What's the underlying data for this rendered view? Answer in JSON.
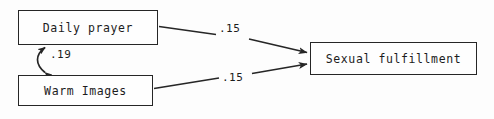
{
  "diagram": {
    "type": "path-diagram",
    "nodes": [
      {
        "id": "daily-prayer",
        "label": "Daily prayer"
      },
      {
        "id": "warm-images",
        "label": "Warm Images"
      },
      {
        "id": "sexual-fulfillment",
        "label": "Sexual fulfillment"
      }
    ],
    "edges": [
      {
        "id": "prayer-to-fulfillment",
        "from": "daily-prayer",
        "to": "sexual-fulfillment",
        "coefficient": ".15",
        "arrow": "single-headed",
        "icon": "arrow-right-icon"
      },
      {
        "id": "images-to-fulfillment",
        "from": "warm-images",
        "to": "sexual-fulfillment",
        "coefficient": ".15",
        "arrow": "single-headed",
        "icon": "arrow-right-icon"
      },
      {
        "id": "prayer-images-correlation",
        "from": "daily-prayer",
        "to": "warm-images",
        "coefficient": ".19",
        "arrow": "double-headed-curved",
        "icon": "double-arrow-curved-icon"
      }
    ],
    "colors": {
      "stroke": "#262626",
      "text": "#1c1c1c",
      "background": "#fdfdfd",
      "box_fill": "#fefefe"
    }
  }
}
